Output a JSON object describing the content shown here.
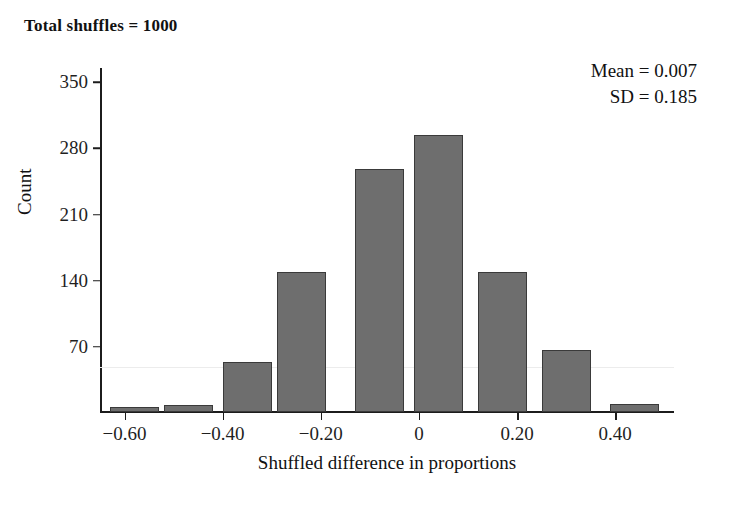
{
  "title": "Total shuffles = 1000",
  "stats": {
    "mean_line": "Mean = 0.007",
    "sd_line": "SD = 0.185"
  },
  "axes": {
    "x_title": "Shuffled difference in proportions",
    "y_title": "Count"
  },
  "chart_data": {
    "type": "bar",
    "title": "Total shuffles = 1000",
    "xlabel": "Shuffled difference in proportions",
    "ylabel": "Count",
    "grid": false,
    "legend": "none",
    "annotations": [
      "Mean = 0.007",
      "SD = 0.185"
    ],
    "bin_width": 0.1,
    "x": [
      -0.55,
      -0.45,
      -0.35,
      -0.25,
      -0.15,
      -0.05,
      0.05,
      0.15,
      0.25,
      0.35,
      0.45
    ],
    "bin_centers": [
      -0.58,
      -0.47,
      -0.35,
      -0.24,
      -0.08,
      0.04,
      0.17,
      0.3,
      0.44
    ],
    "categories": [
      "-0.58",
      "-0.47",
      "-0.35",
      "-0.24",
      "-0.08",
      "0.04",
      "0.17",
      "0.30",
      "0.44"
    ],
    "values": [
      5,
      7,
      53,
      148,
      257,
      293,
      148,
      66,
      8
    ],
    "xlim": [
      -0.65,
      0.52
    ],
    "ylim": [
      0,
      365
    ],
    "xticks": [
      -0.6,
      -0.4,
      -0.2,
      0,
      0.2,
      0.4
    ],
    "xtick_labels": [
      "−0.60",
      "−0.40",
      "−0.20",
      "0",
      "0.20",
      "0.40"
    ],
    "yticks": [
      70,
      140,
      210,
      280,
      350
    ],
    "ytick_labels": [
      "70",
      "140",
      "210",
      "280",
      "350"
    ],
    "bar_color": "#6e6e6e",
    "bar_edge_color": "#3a3a3a"
  }
}
